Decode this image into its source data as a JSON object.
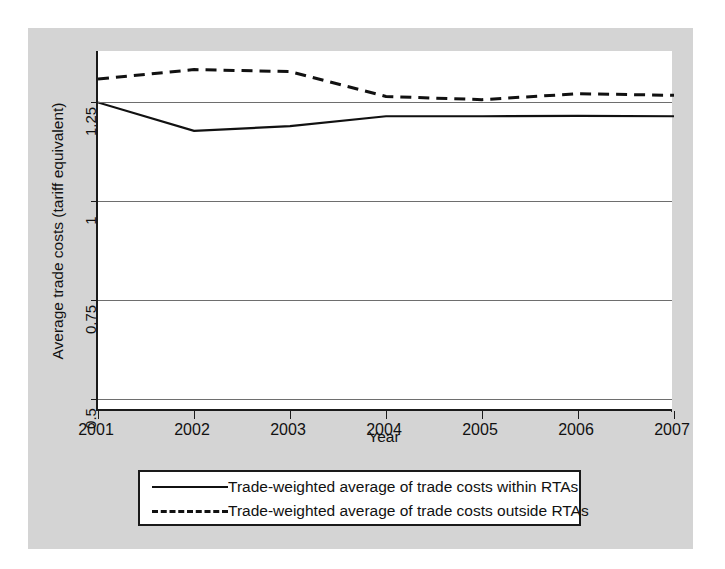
{
  "chart_data": {
    "type": "line",
    "title": "",
    "xlabel": "Year",
    "ylabel": "Average trade costs (tariff equivalent)",
    "x": [
      2001,
      2002,
      2003,
      2004,
      2005,
      2006,
      2007
    ],
    "xticklabels": [
      "2001",
      "2002",
      "2003",
      "2004",
      "2005",
      "2006",
      "2007"
    ],
    "yticks": [
      0.5,
      0.75,
      1,
      1.25
    ],
    "yticklabels": [
      "0.5",
      "0.75",
      "1",
      "1.25"
    ],
    "ylim": [
      0.47,
      1.38
    ],
    "xlim": [
      2001,
      2007
    ],
    "grid": "horizontal",
    "legend_position": "below-axes",
    "series": [
      {
        "name": "Trade-weighted average of trade costs within RTAs",
        "style": "solid",
        "color": "#111111",
        "values": [
          1.25,
          1.178,
          1.19,
          1.215,
          1.215,
          1.216,
          1.215
        ]
      },
      {
        "name": "Trade-weighted average of trade costs outside RTAs",
        "style": "dashed",
        "color": "#111111",
        "values": [
          1.309,
          1.333,
          1.328,
          1.265,
          1.257,
          1.272,
          1.268
        ]
      }
    ]
  },
  "legend": {
    "entries": [
      {
        "label": "Trade-weighted average of trade costs within RTAs",
        "key": "solid-line-key"
      },
      {
        "label": "Trade-weighted average of trade costs outside RTAs",
        "key": "dashed-line-key"
      }
    ]
  },
  "axes": {
    "y_axis_title": "Average trade costs (tariff equivalent)",
    "x_axis_title": "Year"
  }
}
